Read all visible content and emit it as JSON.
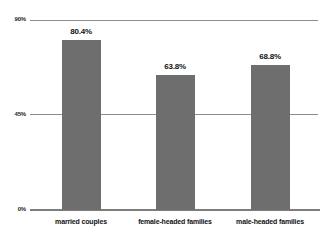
{
  "chart_data": {
    "type": "bar",
    "title": "",
    "subtitle": "",
    "xlabel": "",
    "ylabel": "",
    "categories": [
      "married couples",
      "female-headed families",
      "male-headed families"
    ],
    "values": [
      80.4,
      68.8,
      68.8
    ],
    "value_labels": [
      "80.4%",
      "63.8%",
      "68.8%"
    ],
    "series": [
      {
        "name": "",
        "values": [
          80.4,
          63.8,
          68.8
        ]
      }
    ],
    "ylim": [
      0,
      90
    ],
    "yticks": [
      0,
      45,
      90
    ],
    "ytick_labels": [
      "0%",
      "45%",
      "90%"
    ],
    "grid": true,
    "legend": "none",
    "bar_color": "#6e6e6e",
    "gridline_color": "#8d8d8d",
    "axis_color": "#7d7d7d",
    "text_color": "#111111",
    "background": "#ffffff"
  },
  "axis": {
    "y": {
      "tick_90": "90%",
      "tick_45": "45%",
      "tick_0": "0%"
    }
  },
  "bars": [
    {
      "label": "married couples",
      "value_label": "80.4%",
      "value": 80.4
    },
    {
      "label": "female-headed families",
      "value_label": "63.8%",
      "value": 63.8
    },
    {
      "label": "male-headed families",
      "value_label": "68.8%",
      "value": 68.8
    }
  ]
}
